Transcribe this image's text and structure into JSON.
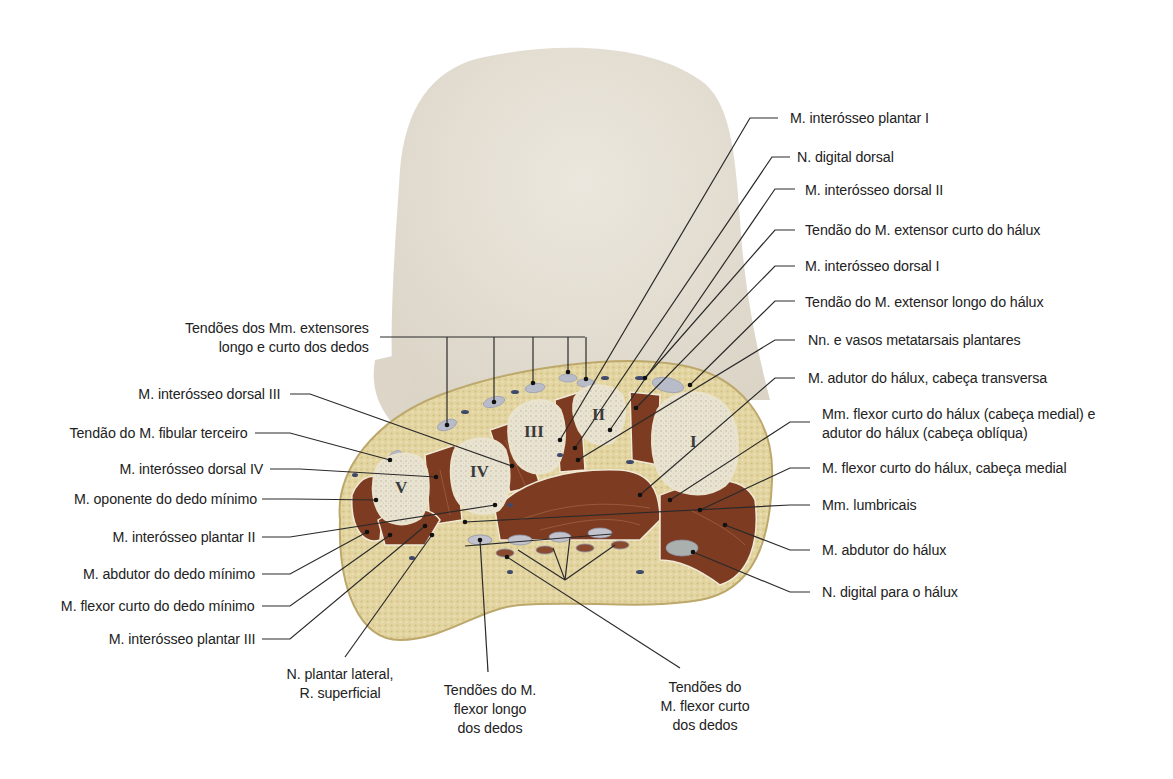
{
  "figure": {
    "colors": {
      "skin_surface": "#e6e0d4",
      "fat": "#e2d39e",
      "fat_dark": "#cdb97a",
      "muscle": "#7a3a22",
      "muscle_light": "#9a5030",
      "bone_cortex": "#efeadb",
      "bone_marrow": "#ddd6c2",
      "tendon": "#b9bcc8",
      "vessel": "#3e4a6a",
      "leader_line": "#2a2a2a"
    },
    "bone_numerals": [
      "I",
      "II",
      "III",
      "IV",
      "V"
    ]
  },
  "labels_right": [
    {
      "id": "interosseo-plantar-1",
      "text": "M. interósseo plantar I"
    },
    {
      "id": "digital-dorsal",
      "text": "N. digital dorsal"
    },
    {
      "id": "interosseo-dorsal-2",
      "text": "M. interósseo dorsal II"
    },
    {
      "id": "extensor-curto-halux",
      "text": "Tendão do M. extensor curto do hálux"
    },
    {
      "id": "interosseo-dorsal-1",
      "text": "M. interósseo dorsal I"
    },
    {
      "id": "extensor-longo-halux",
      "text": "Tendão do M. extensor longo do hálux"
    },
    {
      "id": "metatarsais-plantares",
      "text": "Nn. e vasos metatarsais plantares"
    },
    {
      "id": "adutor-transversa",
      "text": "M. adutor do hálux, cabeça transversa"
    },
    {
      "id": "flexor-adutor-obliqua",
      "text": "Mm. flexor curto do hálux (cabeça medial) e",
      "text2": "adutor do hálux (cabeça oblíqua)"
    },
    {
      "id": "flexor-curto-medial",
      "text": "M. flexor curto do hálux, cabeça medial"
    },
    {
      "id": "lumbricais",
      "text": "Mm. lumbricais"
    },
    {
      "id": "abdutor-halux",
      "text": "M. abdutor do hálux"
    },
    {
      "id": "digital-halux",
      "text": "N. digital para o hálux"
    }
  ],
  "labels_left": [
    {
      "id": "extensores-dedos",
      "text": "Tendões dos Mm. extensores",
      "text2": "longo e curto dos dedos"
    },
    {
      "id": "interosseo-dorsal-3",
      "text": "M. interósseo dorsal III"
    },
    {
      "id": "fibular-terceiro",
      "text": "Tendão do M. fibular terceiro"
    },
    {
      "id": "interosseo-dorsal-4",
      "text": "M. interósseo dorsal IV"
    },
    {
      "id": "oponente-minimo",
      "text": "M. oponente do dedo mínimo"
    },
    {
      "id": "interosseo-plantar-2",
      "text": "M. interósseo plantar II"
    },
    {
      "id": "abdutor-minimo",
      "text": "M. abdutor do dedo mínimo"
    },
    {
      "id": "flexor-curto-minimo",
      "text": "M. flexor curto do dedo mínimo"
    },
    {
      "id": "interosseo-plantar-3",
      "text": "M. interósseo plantar III"
    }
  ],
  "labels_bottom": [
    {
      "id": "plantar-lateral",
      "text": "N. plantar lateral,",
      "text2": "R. superficial"
    },
    {
      "id": "flexor-longo-dedos",
      "text": "Tendões do M.",
      "text2": "flexor longo",
      "text3": "dos dedos"
    },
    {
      "id": "flexor-curto-dedos",
      "text": "Tendões do",
      "text2": "M. flexor curto",
      "text3": "dos dedos"
    }
  ]
}
